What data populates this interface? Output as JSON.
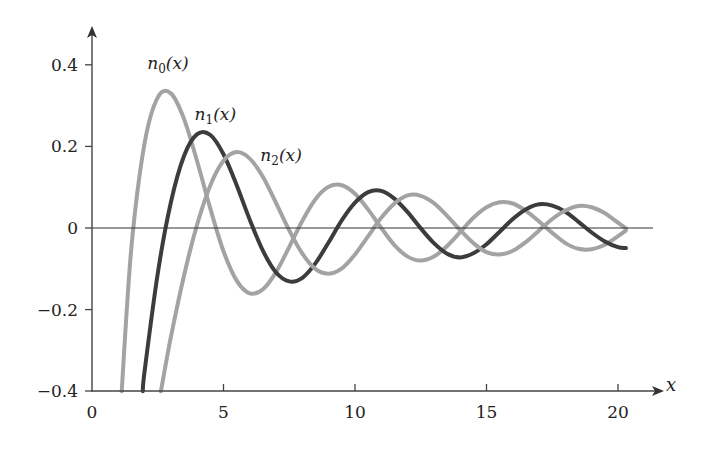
{
  "chart_data": {
    "type": "line",
    "title": "",
    "xlabel": "x",
    "ylabel": "",
    "xlim": [
      0,
      21.5
    ],
    "ylim": [
      -0.4,
      0.45
    ],
    "grid": false,
    "legend": "inline labels near curve peaks",
    "x_ticks": [
      {
        "value": 0,
        "label": "0"
      },
      {
        "value": 5,
        "label": "5"
      },
      {
        "value": 10,
        "label": "10"
      },
      {
        "value": 15,
        "label": "15"
      },
      {
        "value": 20,
        "label": "20"
      }
    ],
    "y_ticks": [
      {
        "value": 0.4,
        "label": "0.4"
      },
      {
        "value": 0.2,
        "label": "0.2"
      },
      {
        "value": 0,
        "label": "0"
      },
      {
        "value": -0.2,
        "label": "−0.2"
      },
      {
        "value": -0.4,
        "label": "−0.4"
      }
    ],
    "series": [
      {
        "name": "n0(x)",
        "label_main": "n",
        "label_sub": "0",
        "label_arg": "(x)",
        "label_pos": [
          2.1,
          0.39
        ],
        "color": "#a3a3a3",
        "x": [
          1.13,
          1.5,
          2.0,
          2.5,
          3.0,
          3.5,
          4.0,
          4.5,
          5.0,
          5.5,
          6.0,
          6.5,
          7.0,
          7.5,
          8.0,
          8.5,
          9.0,
          9.5,
          10.0,
          10.5,
          11.0,
          11.5,
          12.0,
          12.5,
          13.0,
          13.5,
          14.0,
          14.5,
          15.0,
          15.5,
          16.0,
          16.5,
          17.0,
          17.5,
          18.0,
          18.5,
          19.0,
          19.5,
          20.0,
          20.3
        ],
        "y": [
          -0.4,
          -0.047,
          0.208,
          0.32,
          0.33,
          0.267,
          0.163,
          0.047,
          -0.057,
          -0.129,
          -0.16,
          -0.15,
          -0.108,
          -0.046,
          0.018,
          0.071,
          0.101,
          0.105,
          0.084,
          0.045,
          0.0,
          -0.042,
          -0.07,
          -0.08,
          -0.07,
          -0.044,
          -0.01,
          0.025,
          0.051,
          0.063,
          0.06,
          0.042,
          0.016,
          -0.012,
          -0.037,
          -0.051,
          -0.052,
          -0.041,
          -0.02,
          -0.006
        ]
      },
      {
        "name": "n1(x)",
        "label_main": "n",
        "label_sub": "1",
        "label_arg": "(x)",
        "label_pos": [
          3.9,
          0.265
        ],
        "color": "#3c3c3c",
        "x": [
          1.93,
          2.0,
          2.5,
          3.0,
          3.5,
          4.0,
          4.5,
          5.0,
          5.5,
          6.0,
          6.5,
          7.0,
          7.5,
          8.0,
          8.5,
          9.0,
          9.5,
          10.0,
          10.5,
          11.0,
          11.5,
          12.0,
          12.5,
          13.0,
          13.5,
          14.0,
          14.5,
          15.0,
          15.5,
          16.0,
          16.5,
          17.0,
          17.5,
          18.0,
          18.5,
          19.0,
          19.5,
          20.0,
          20.3
        ],
        "y": [
          -0.4,
          -0.351,
          -0.111,
          0.063,
          0.177,
          0.23,
          0.228,
          0.181,
          0.105,
          0.02,
          -0.056,
          -0.109,
          -0.131,
          -0.122,
          -0.086,
          -0.035,
          0.019,
          0.062,
          0.088,
          0.091,
          0.072,
          0.039,
          -0.001,
          -0.037,
          -0.063,
          -0.072,
          -0.062,
          -0.04,
          -0.009,
          0.022,
          0.046,
          0.058,
          0.055,
          0.04,
          0.015,
          -0.011,
          -0.033,
          -0.047,
          -0.049
        ]
      },
      {
        "name": "n2(x)",
        "label_main": "n",
        "label_sub": "2",
        "label_arg": "(x)",
        "label_pos": [
          6.4,
          0.165
        ],
        "color": "#a3a3a3",
        "x": [
          2.62,
          3.0,
          3.5,
          4.0,
          4.5,
          5.0,
          5.5,
          6.0,
          6.5,
          7.0,
          7.5,
          8.0,
          8.5,
          9.0,
          9.5,
          10.0,
          10.5,
          11.0,
          11.5,
          12.0,
          12.5,
          13.0,
          13.5,
          14.0,
          14.5,
          15.0,
          15.5,
          16.0,
          16.5,
          17.0,
          17.5,
          18.0,
          18.5,
          19.0,
          19.5,
          20.0,
          20.3
        ],
        "y": [
          -0.4,
          -0.267,
          -0.116,
          0.009,
          0.105,
          0.165,
          0.186,
          0.17,
          0.125,
          0.061,
          -0.006,
          -0.063,
          -0.101,
          -0.112,
          -0.099,
          -0.065,
          -0.02,
          0.025,
          0.06,
          0.08,
          0.079,
          0.061,
          0.03,
          -0.005,
          -0.037,
          -0.059,
          -0.065,
          -0.056,
          -0.034,
          -0.006,
          0.022,
          0.043,
          0.054,
          0.051,
          0.036,
          0.013,
          -0.001
        ]
      }
    ]
  }
}
